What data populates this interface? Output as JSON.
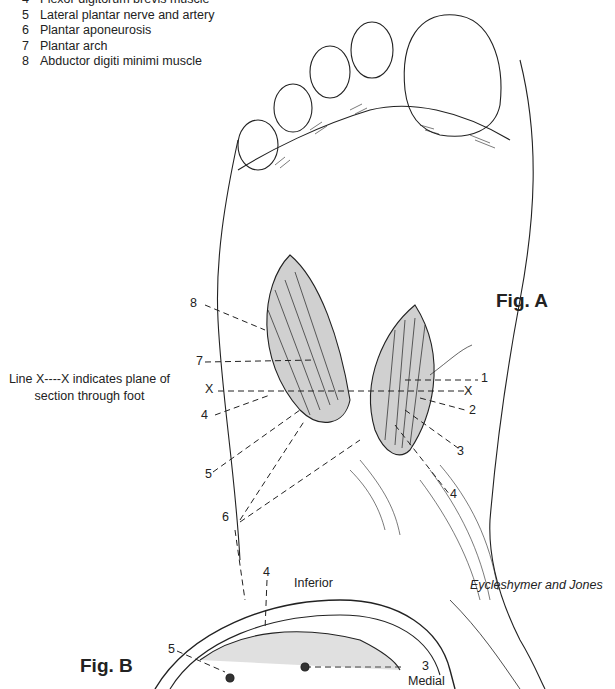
{
  "legend": {
    "items": [
      {
        "num": "4",
        "label": "Flexor digitorum brevis muscle"
      },
      {
        "num": "5",
        "label": "Lateral plantar nerve and artery"
      },
      {
        "num": "6",
        "label": "Plantar aponeurosis"
      },
      {
        "num": "7",
        "label": "Plantar arch"
      },
      {
        "num": "8",
        "label": "Abductor digiti minimi muscle"
      }
    ]
  },
  "note": {
    "line1": "Line X----X indicates plane of",
    "line2": "section through foot"
  },
  "figure_a": {
    "title": "Fig. A",
    "callouts": {
      "left": [
        "8",
        "7",
        "X",
        "4",
        "5"
      ],
      "right": [
        "1",
        "X",
        "2",
        "3",
        "4"
      ],
      "bottom": "6"
    }
  },
  "figure_b": {
    "title": "Fig. B",
    "orientation": {
      "inferior": "Inferior",
      "medial": "Medial"
    },
    "callouts": [
      "4",
      "5",
      "3"
    ]
  },
  "credit": "Eycleshymer and Jones"
}
